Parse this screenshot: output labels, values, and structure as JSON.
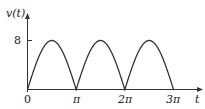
{
  "chart_data": {
    "type": "line",
    "title": "",
    "xlabel": "t",
    "ylabel": "v(t)",
    "x_ticks": [
      "0",
      "π",
      "2π",
      "3π"
    ],
    "x_tick_values": [
      0,
      3.14159,
      6.28318,
      9.42478
    ],
    "y_ticks": [
      "8"
    ],
    "y_tick_values": [
      8
    ],
    "xlim": [
      0,
      9.42478
    ],
    "ylim": [
      0,
      8
    ],
    "grid": false,
    "legend": null,
    "series": [
      {
        "name": "v(t) = 8|sin t|",
        "description": "Full-wave rectified sine, amplitude 8, period π",
        "x": [
          0,
          0.785,
          1.571,
          2.356,
          3.142,
          3.927,
          4.712,
          5.498,
          6.283,
          7.069,
          7.854,
          8.639,
          9.425
        ],
        "values": [
          0,
          5.66,
          8,
          5.66,
          0,
          5.66,
          8,
          5.66,
          0,
          5.66,
          8,
          5.66,
          0
        ]
      }
    ],
    "color": "#333333"
  },
  "labels": {
    "y_axis": "v(t)",
    "x_axis": "t",
    "y_tick_8": "8",
    "x_tick_0": "0",
    "x_tick_pi": "π",
    "x_tick_2pi": "2π",
    "x_tick_3pi": "3π"
  }
}
